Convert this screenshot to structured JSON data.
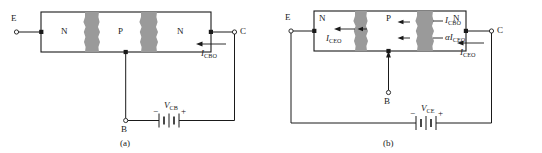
{
  "figure": {
    "panels": [
      {
        "id": "a",
        "caption": "(a)",
        "configuration": "common-base",
        "device": {
          "type": "npn",
          "regions": [
            {
              "label": "N",
              "role": "emitter"
            },
            {
              "label": "P",
              "role": "base"
            },
            {
              "label": "N",
              "role": "collector"
            }
          ],
          "depletion_regions": 2,
          "depletion_color": "#9a9a9a"
        },
        "terminals": [
          {
            "name": "E",
            "label": "E",
            "position": "left"
          },
          {
            "name": "B",
            "label": "B",
            "position": "bottom"
          },
          {
            "name": "C",
            "label": "C",
            "position": "right"
          }
        ],
        "currents": [
          {
            "symbol": "I",
            "subscript": "CBO",
            "label": "I_CBO",
            "direction": "left",
            "location": "collector-lead"
          }
        ],
        "source": {
          "type": "battery",
          "symbol": "V",
          "subscript": "CB",
          "label": "V_CB",
          "minus": "−",
          "plus": "+",
          "cells": 2
        }
      },
      {
        "id": "b",
        "caption": "(b)",
        "configuration": "common-emitter",
        "device": {
          "type": "npn",
          "regions": [
            {
              "label": "N",
              "role": "emitter"
            },
            {
              "label": "P",
              "role": "base"
            },
            {
              "label": "N",
              "role": "collector"
            }
          ],
          "depletion_regions": 2,
          "depletion_color": "#9a9a9a"
        },
        "terminals": [
          {
            "name": "E",
            "label": "E",
            "position": "left"
          },
          {
            "name": "B",
            "label": "B",
            "position": "bottom"
          },
          {
            "name": "C",
            "label": "C",
            "position": "right"
          }
        ],
        "currents": [
          {
            "symbol": "I",
            "subscript": "CEO",
            "label": "I_CEO",
            "direction": "left",
            "location": "emitter-region"
          },
          {
            "symbol": "I",
            "subscript": "CBO",
            "label": "I_CBO",
            "direction": "left",
            "location": "collector-junction-upper"
          },
          {
            "symbol": "αI",
            "subscript": "CEO",
            "label": "alpha_I_CEO",
            "direction": "left",
            "location": "collector-junction-lower"
          },
          {
            "symbol": "I",
            "subscript": "CEO",
            "label": "I_CEO",
            "direction": "left",
            "location": "collector-lead"
          }
        ],
        "source": {
          "type": "battery",
          "symbol": "V",
          "subscript": "CE",
          "label": "V_CE",
          "minus": "−",
          "plus": "+",
          "cells": 2
        }
      }
    ],
    "colors": {
      "line": "#1a1a1a",
      "depletion": "#9a9a9a",
      "background": "#ffffff"
    }
  }
}
